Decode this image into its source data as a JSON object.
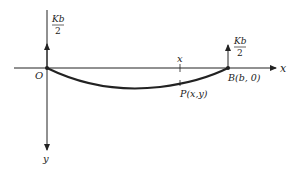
{
  "diagram": {
    "axes": {
      "x_label": "x",
      "y_label": "y",
      "origin_label": "O"
    },
    "points": {
      "origin": "O",
      "end": "B(b, 0)",
      "curve_point": "P(x,y)",
      "x_tick_label": "x"
    },
    "forces": {
      "left": {
        "numerator": "Kb",
        "denominator": "2"
      },
      "right": {
        "numerator": "Kb",
        "denominator": "2"
      }
    },
    "colors": {
      "line": "#222222",
      "background": "#ffffff"
    }
  }
}
